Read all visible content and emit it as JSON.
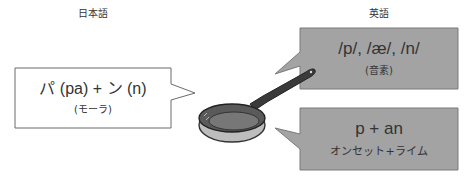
{
  "labels": {
    "japanese": "日本語",
    "english": "英語"
  },
  "japanese_box": {
    "main": "パ (pa) + ン (n)",
    "sub": "(モーラ)"
  },
  "english_top_box": {
    "main": "/p/, /æ/, /n/",
    "sub": "(音素)"
  },
  "english_bottom_box": {
    "main": "p + an",
    "sub": "オンセット+ライム"
  },
  "colors": {
    "gray_box": "#a3a3a3",
    "white_box": "#ffffff",
    "border": "#6b6b6b"
  }
}
